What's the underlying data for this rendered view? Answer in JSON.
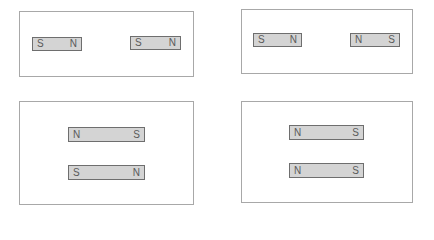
{
  "colors": {
    "panel_border": "#a8a8a8",
    "magnet_fill": "#d4d4d4",
    "magnet_border": "#6e6e6e",
    "pole_text": "#5a5a5a"
  },
  "panels": [
    {
      "id": "top-left",
      "magnets": [
        {
          "left": "S",
          "right": "N"
        },
        {
          "left": "S",
          "right": "N"
        }
      ]
    },
    {
      "id": "top-right",
      "magnets": [
        {
          "left": "S",
          "right": "N"
        },
        {
          "left": "N",
          "right": "S"
        }
      ]
    },
    {
      "id": "bottom-left",
      "magnets": [
        {
          "left": "N",
          "right": "S"
        },
        {
          "left": "S",
          "right": "N"
        }
      ]
    },
    {
      "id": "bottom-right",
      "magnets": [
        {
          "left": "N",
          "right": "S"
        },
        {
          "left": "N",
          "right": "S"
        }
      ]
    }
  ]
}
